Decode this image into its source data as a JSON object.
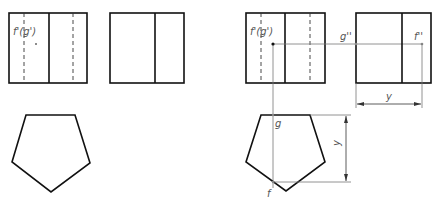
{
  "colors": {
    "outline": "#111111",
    "thin": "#666666",
    "label": "#555555",
    "background": "#ffffff"
  },
  "left_figure": {
    "front_view": {
      "label": "f'(g')"
    },
    "side_view": {},
    "top_view": {
      "shape": "pentagon"
    }
  },
  "right_figure": {
    "front_view": {
      "label": "f'(g')"
    },
    "side_view": {
      "label_g": "g''",
      "label_f": "f''"
    },
    "top_view": {
      "shape": "pentagon",
      "label_g": "g",
      "label_f": "f"
    },
    "dimensions": {
      "horizontal_label": "y",
      "vertical_label": "y"
    }
  }
}
